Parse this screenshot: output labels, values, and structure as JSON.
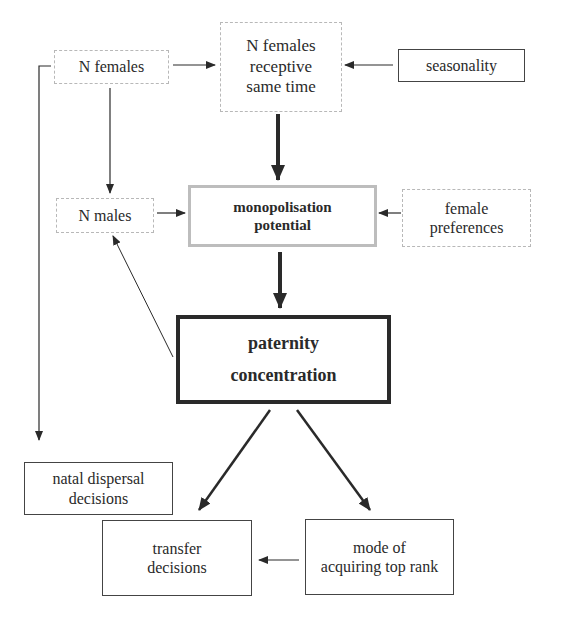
{
  "diagram": {
    "nodes": {
      "n_females": {
        "lines": [
          "N females"
        ]
      },
      "n_females_receptive": {
        "lines": [
          "N females",
          "receptive",
          "same time"
        ]
      },
      "seasonality": {
        "lines": [
          "seasonality"
        ]
      },
      "n_males": {
        "lines": [
          "N males"
        ]
      },
      "monopolisation": {
        "lines": [
          "monopolisation",
          "potential"
        ]
      },
      "female_preferences": {
        "lines": [
          "female",
          "preferences"
        ]
      },
      "paternity": {
        "lines": [
          "paternity",
          "concentration"
        ]
      },
      "natal_dispersal": {
        "lines": [
          "natal dispersal",
          "decisions"
        ]
      },
      "transfer": {
        "lines": [
          "transfer",
          "decisions"
        ]
      },
      "mode_of_acquiring": {
        "lines": [
          "mode of",
          "acquiring top rank"
        ]
      }
    },
    "edges": [
      {
        "from": "N females",
        "to": "N females receptive same time"
      },
      {
        "from": "seasonality",
        "to": "N females receptive same time"
      },
      {
        "from": "N females",
        "to": "N males"
      },
      {
        "from": "N females",
        "to": "natal dispersal decisions"
      },
      {
        "from": "N females receptive same time",
        "to": "monopolisation potential",
        "weight": "thick"
      },
      {
        "from": "N males",
        "to": "monopolisation potential"
      },
      {
        "from": "female preferences",
        "to": "monopolisation potential"
      },
      {
        "from": "monopolisation potential",
        "to": "paternity concentration",
        "weight": "thick"
      },
      {
        "from": "paternity concentration",
        "to": "N males"
      },
      {
        "from": "paternity concentration",
        "to": "transfer decisions",
        "weight": "medium"
      },
      {
        "from": "paternity concentration",
        "to": "mode of acquiring top rank",
        "weight": "medium"
      },
      {
        "from": "mode of acquiring top rank",
        "to": "transfer decisions"
      }
    ],
    "colors": {
      "line": "#2a2a2a",
      "dotted_border": "#b8b8b8",
      "gray_border": "#bdbdbd"
    }
  }
}
